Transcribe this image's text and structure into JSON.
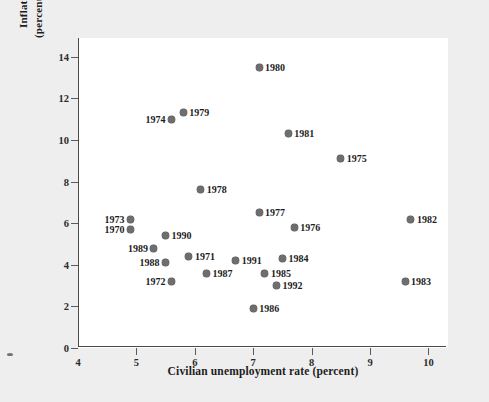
{
  "chart_data": {
    "type": "scatter",
    "title": "",
    "xlabel": "Civilian unemployment rate (percent)",
    "ylabel_line1": "Inflation",
    "ylabel_line2": "(percent per year)",
    "xlim": [
      4,
      10.3
    ],
    "ylim": [
      0,
      14.9
    ],
    "x_ticks": [
      4,
      5,
      6,
      7,
      8,
      9,
      10
    ],
    "y_ticks": [
      0,
      2,
      4,
      6,
      8,
      10,
      12,
      14
    ],
    "grid": false,
    "legend": "none",
    "point_color": "#6e6e6e",
    "plot_background": "#ffffff",
    "figure_background": "#eeeeee",
    "points": [
      {
        "label": "1980",
        "x": 7.1,
        "y": 13.5,
        "label_side": "right"
      },
      {
        "label": "1979",
        "x": 5.8,
        "y": 11.3,
        "label_side": "right"
      },
      {
        "label": "1974",
        "x": 5.6,
        "y": 11.0,
        "label_side": "left"
      },
      {
        "label": "1981",
        "x": 7.6,
        "y": 10.3,
        "label_side": "right"
      },
      {
        "label": "1975",
        "x": 8.5,
        "y": 9.1,
        "label_side": "right"
      },
      {
        "label": "1978",
        "x": 6.1,
        "y": 7.6,
        "label_side": "right"
      },
      {
        "label": "1977",
        "x": 7.1,
        "y": 6.5,
        "label_side": "right"
      },
      {
        "label": "1982",
        "x": 9.7,
        "y": 6.2,
        "label_side": "right"
      },
      {
        "label": "1973",
        "x": 4.9,
        "y": 6.2,
        "label_side": "left"
      },
      {
        "label": "1976",
        "x": 7.7,
        "y": 5.8,
        "label_side": "right"
      },
      {
        "label": "1970",
        "x": 4.9,
        "y": 5.7,
        "label_side": "left"
      },
      {
        "label": "1990",
        "x": 5.5,
        "y": 5.4,
        "label_side": "right"
      },
      {
        "label": "1989",
        "x": 5.3,
        "y": 4.8,
        "label_side": "left"
      },
      {
        "label": "1971",
        "x": 5.9,
        "y": 4.4,
        "label_side": "right"
      },
      {
        "label": "1984",
        "x": 7.5,
        "y": 4.3,
        "label_side": "right"
      },
      {
        "label": "1991",
        "x": 6.7,
        "y": 4.2,
        "label_side": "right"
      },
      {
        "label": "1988",
        "x": 5.5,
        "y": 4.1,
        "label_side": "left"
      },
      {
        "label": "1987",
        "x": 6.2,
        "y": 3.6,
        "label_side": "right"
      },
      {
        "label": "1985",
        "x": 7.2,
        "y": 3.6,
        "label_side": "right"
      },
      {
        "label": "1972",
        "x": 5.6,
        "y": 3.2,
        "label_side": "left"
      },
      {
        "label": "1983",
        "x": 9.6,
        "y": 3.2,
        "label_side": "right"
      },
      {
        "label": "1992",
        "x": 7.4,
        "y": 3.0,
        "label_side": "right"
      },
      {
        "label": "1986",
        "x": 7.0,
        "y": 1.9,
        "label_side": "right"
      }
    ]
  }
}
